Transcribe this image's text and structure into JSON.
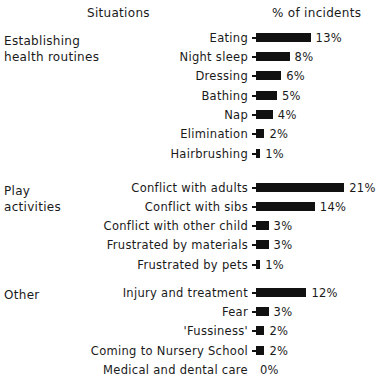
{
  "header": {
    "situations": "Situations",
    "percent": "% of incidents"
  },
  "groups": [
    {
      "label_line1": "Establishing",
      "label_line2": "health routines"
    },
    {
      "label_line1": "Play",
      "label_line2": "activities"
    },
    {
      "label_line1": "Other",
      "label_line2": ""
    }
  ],
  "rows": [
    {
      "label": "Eating",
      "value": "13%"
    },
    {
      "label": "Night sleep",
      "value": "8%"
    },
    {
      "label": "Dressing",
      "value": "6%"
    },
    {
      "label": "Bathing",
      "value": "5%"
    },
    {
      "label": "Nap",
      "value": "4%"
    },
    {
      "label": "Elimination",
      "value": "2%"
    },
    {
      "label": "Hairbrushing",
      "value": "1%"
    },
    {
      "label": "Conflict with adults",
      "value": "21%"
    },
    {
      "label": "Conflict with sibs",
      "value": "14%"
    },
    {
      "label": "Conflict with other child",
      "value": "3%"
    },
    {
      "label": "Frustrated by materials",
      "value": "3%"
    },
    {
      "label": "Frustrated by pets",
      "value": "1%"
    },
    {
      "label": "Injury and treatment",
      "value": "12%"
    },
    {
      "label": "Fear",
      "value": "3%"
    },
    {
      "label": "'Fussiness'",
      "value": "2%"
    },
    {
      "label": "Coming to Nursery School",
      "value": "2%"
    },
    {
      "label": "Medical and dental care",
      "value": "0%"
    }
  ],
  "chart_data": {
    "type": "bar",
    "orientation": "horizontal",
    "title": "",
    "xlabel": "% of incidents",
    "ylabel": "Situations",
    "groups": [
      {
        "name": "Establishing health routines",
        "categories": [
          "Eating",
          "Night sleep",
          "Dressing",
          "Bathing",
          "Nap",
          "Elimination",
          "Hairbrushing"
        ],
        "values": [
          13,
          8,
          6,
          5,
          4,
          2,
          1
        ]
      },
      {
        "name": "Play activities",
        "categories": [
          "Conflict with adults",
          "Conflict with sibs",
          "Conflict with other child",
          "Frustrated by materials",
          "Frustrated by pets"
        ],
        "values": [
          21,
          14,
          3,
          3,
          1
        ]
      },
      {
        "name": "Other",
        "categories": [
          "Injury and treatment",
          "Fear",
          "'Fussiness'",
          "Coming to Nursery School",
          "Medical and dental care"
        ],
        "values": [
          12,
          3,
          2,
          2,
          0
        ]
      }
    ],
    "categories": [
      "Eating",
      "Night sleep",
      "Dressing",
      "Bathing",
      "Nap",
      "Elimination",
      "Hairbrushing",
      "Conflict with adults",
      "Conflict with sibs",
      "Conflict with other child",
      "Frustrated by materials",
      "Frustrated by pets",
      "Injury and treatment",
      "Fear",
      "'Fussiness'",
      "Coming to Nursery School",
      "Medical and dental care"
    ],
    "values": [
      13,
      8,
      6,
      5,
      4,
      2,
      1,
      21,
      14,
      3,
      3,
      1,
      12,
      3,
      2,
      2,
      0
    ],
    "value_unit": "%",
    "grid": false,
    "legend": "none"
  }
}
